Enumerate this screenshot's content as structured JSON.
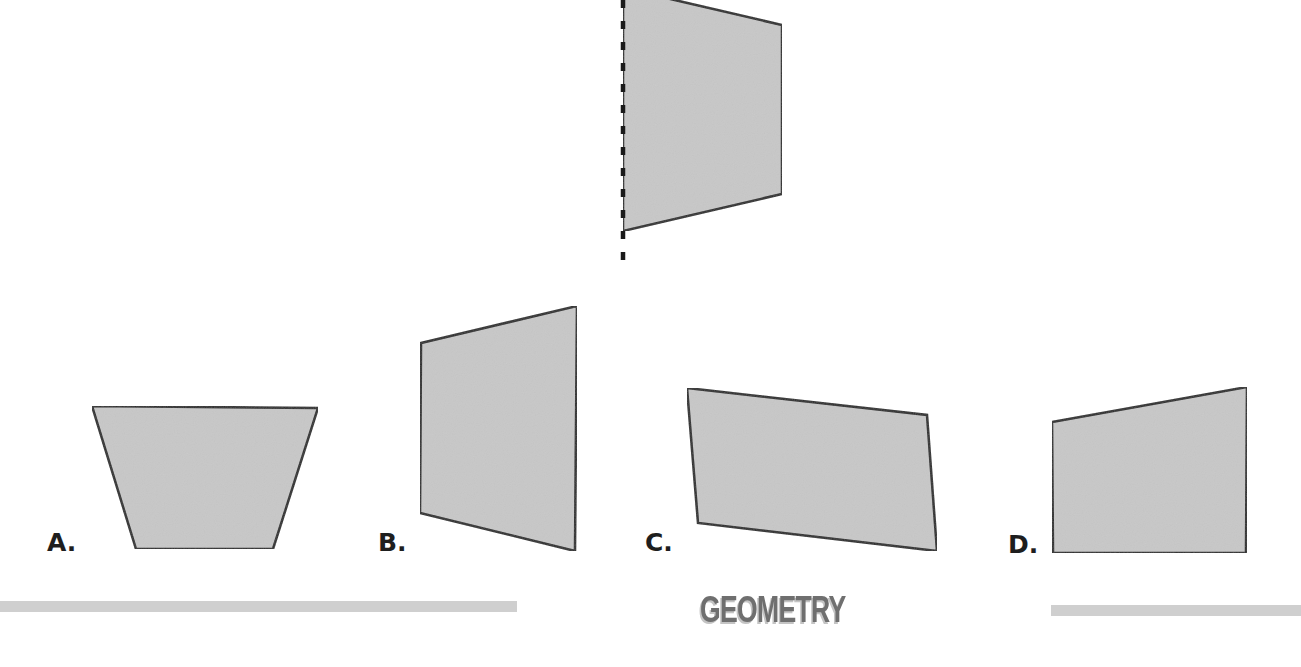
{
  "page": {
    "background": "#ffffff",
    "fill_color": "#c8c8c8",
    "stroke_color": "#2a2a2a"
  },
  "reference_figure": {
    "description": "quadrilateral with dashed line of reflection on its left edge",
    "points": [
      [
        623,
        -12
      ],
      [
        782,
        25
      ],
      [
        782,
        194
      ],
      [
        623,
        231
      ]
    ],
    "mirror_line": {
      "x": 623,
      "y_start": 0,
      "y_end": 262,
      "style": "dashed"
    }
  },
  "options": [
    {
      "label": "A.",
      "label_pos": [
        47,
        530
      ],
      "points": [
        [
          92,
          406
        ],
        [
          318,
          408
        ],
        [
          273,
          549
        ],
        [
          136,
          549
        ]
      ]
    },
    {
      "label": "B.",
      "label_pos": [
        378,
        530
      ],
      "points": [
        [
          421,
          343
        ],
        [
          577,
          306
        ],
        [
          575,
          551
        ],
        [
          420,
          513
        ]
      ]
    },
    {
      "label": "C.",
      "label_pos": [
        645,
        530
      ],
      "points": [
        [
          687,
          388
        ],
        [
          927,
          415
        ],
        [
          937,
          551
        ],
        [
          698,
          523
        ]
      ]
    },
    {
      "label": "D.",
      "label_pos": [
        1008,
        532
      ],
      "points": [
        [
          1052,
          422
        ],
        [
          1247,
          387
        ],
        [
          1246,
          553
        ],
        [
          1053,
          553
        ]
      ]
    }
  ],
  "footer": {
    "title": "GEOMETRY",
    "left_rule": {
      "x": 0,
      "width": 517,
      "y": 601
    },
    "right_rule": {
      "x": 1051,
      "width": 250,
      "y": 605
    }
  }
}
